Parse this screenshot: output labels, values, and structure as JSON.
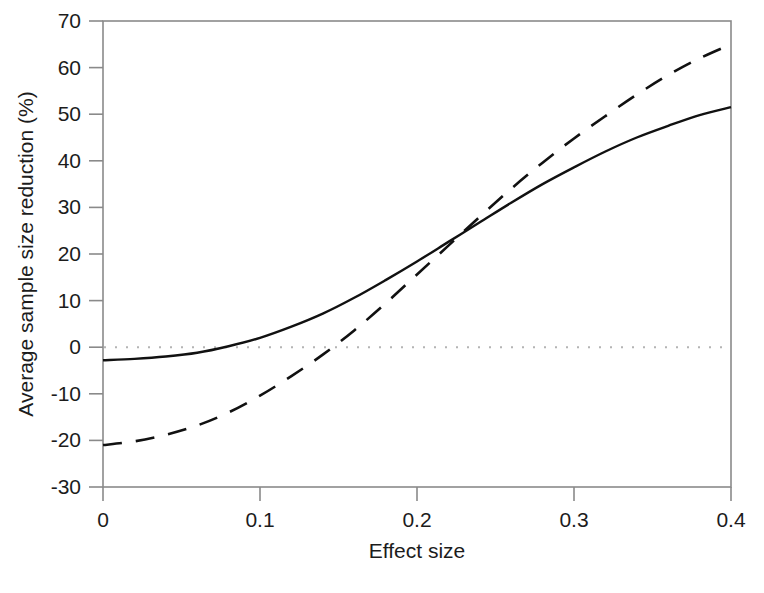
{
  "figure": {
    "caption_fragment": "",
    "background_color": "#ffffff",
    "ink_color": "#1c1c1c"
  },
  "chart_data": {
    "type": "line",
    "title": "",
    "xlabel": "Effect size",
    "ylabel": "Average sample size reduction (%)",
    "xlim": [
      0,
      0.4
    ],
    "ylim": [
      -30,
      70
    ],
    "xticks": [
      0,
      0.1,
      0.2,
      0.3,
      0.4
    ],
    "xticklabels": [
      "0",
      "0.1",
      "0.2",
      "0.3",
      "0.4"
    ],
    "yticks": [
      -30,
      -20,
      -10,
      0,
      10,
      20,
      30,
      40,
      50,
      60,
      70
    ],
    "yticklabels": [
      "-30",
      "-20",
      "-10",
      "0",
      "10",
      "20",
      "30",
      "40",
      "50",
      "60",
      "70"
    ],
    "grid": false,
    "legend": "none",
    "box": true,
    "annotations": [
      {
        "name": "zero-reference-line",
        "type": "hline",
        "y": 0,
        "style": "dotted",
        "color": "#b4b4b4"
      }
    ],
    "x": [
      0,
      0.02,
      0.04,
      0.06,
      0.08,
      0.1,
      0.12,
      0.14,
      0.16,
      0.18,
      0.2,
      0.22,
      0.24,
      0.26,
      0.28,
      0.3,
      0.32,
      0.34,
      0.36,
      0.38,
      0.4
    ],
    "series": [
      {
        "name": "solid-curve",
        "linestyle": "solid",
        "color": "#111111",
        "linewidth": 2.4,
        "values": [
          -2.8,
          -2.5,
          -2.0,
          -1.2,
          0.2,
          2.0,
          4.4,
          7.2,
          10.6,
          14.4,
          18.4,
          22.6,
          26.8,
          31.0,
          35.0,
          38.6,
          42.0,
          45.0,
          47.5,
          49.8,
          51.5
        ]
      },
      {
        "name": "dashed-curve",
        "linestyle": "dashed",
        "color": "#111111",
        "linewidth": 2.6,
        "values": [
          -21.0,
          -20.2,
          -18.8,
          -16.8,
          -14.0,
          -10.4,
          -6.2,
          -1.6,
          3.6,
          9.4,
          15.6,
          21.8,
          28.0,
          34.0,
          39.6,
          44.8,
          49.6,
          54.2,
          58.4,
          62.0,
          65.0
        ]
      }
    ],
    "crossing_point": {
      "x": 0.195,
      "y": 18.0
    }
  }
}
